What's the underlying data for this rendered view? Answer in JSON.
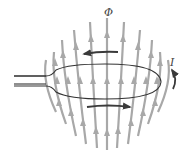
{
  "diagram": {
    "labels": {
      "flux": "Φ",
      "current": "I"
    },
    "colors": {
      "field_lines": "#a8a8a8",
      "loop": "#333333",
      "circulation_arrows": "#3a3a3a",
      "background": "#ffffff"
    },
    "field_line_direction": "up",
    "circulation": {
      "top_arrow_direction": "left",
      "bottom_arrow_direction": "right",
      "current_arrow_direction": "counterclockwise"
    }
  }
}
